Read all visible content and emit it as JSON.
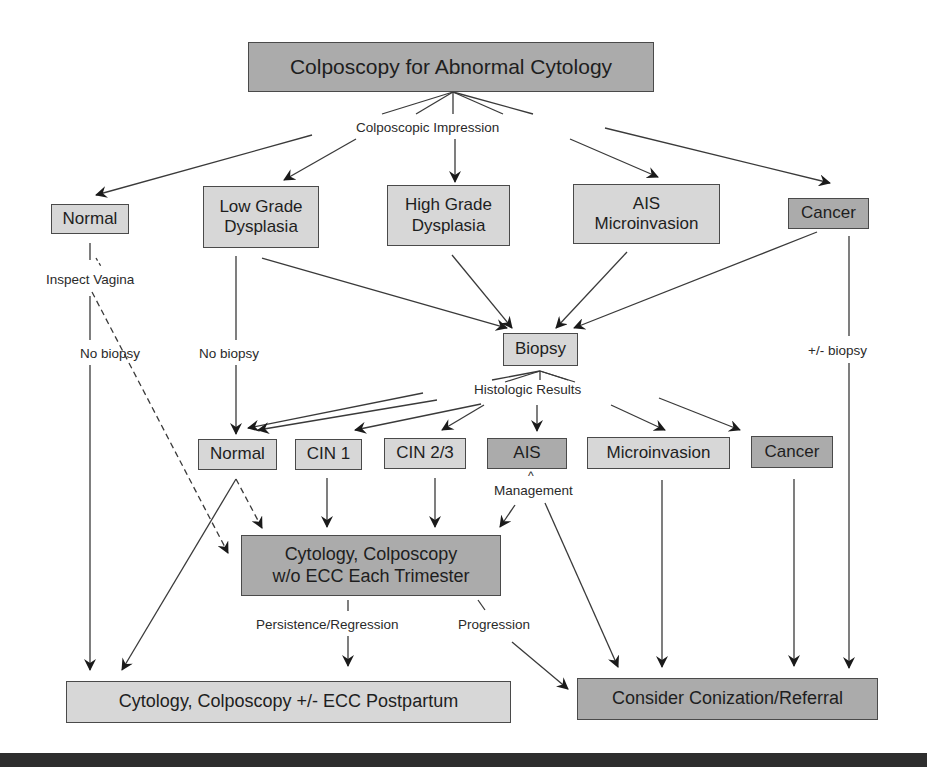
{
  "title": "Colposcopy for Abnormal Cytology",
  "edge_labels": {
    "colposcopic_impression": "Colposcopic Impression",
    "inspect_vagina": "Inspect Vagina",
    "no_biopsy_left": "No biopsy",
    "no_biopsy_mid": "No biopsy",
    "plus_minus_biopsy": "+/- biopsy",
    "histologic_results": "Histologic Results",
    "management_caret": "^",
    "management": "Management",
    "persistence_regression": "Persistence/Regression",
    "progression": "Progression"
  },
  "impression_nodes": {
    "normal": "Normal",
    "low_grade": [
      "Low Grade",
      "Dysplasia"
    ],
    "high_grade": [
      "High Grade",
      "Dysplasia"
    ],
    "ais_micro": [
      "AIS",
      "Microinvasion"
    ],
    "cancer": "Cancer"
  },
  "biopsy": "Biopsy",
  "histologic_nodes": {
    "normal": "Normal",
    "cin1": "CIN 1",
    "cin23": "CIN 2/3",
    "ais": "AIS",
    "microinvasion": "Microinvasion",
    "cancer": "Cancer"
  },
  "followup_node": [
    "Cytology, Colposcopy",
    "w/o ECC Each Trimester"
  ],
  "outcomes": {
    "postpartum": "Cytology, Colposcopy +/- ECC Postpartum",
    "conization": "Consider Conization/Referral"
  },
  "colors": {
    "light_fill": "#d7d7d7",
    "dark_fill": "#ababab",
    "border": "#4a4a4a",
    "line": "#2e2e2e",
    "bottom_bar": "#2e2e2e"
  }
}
